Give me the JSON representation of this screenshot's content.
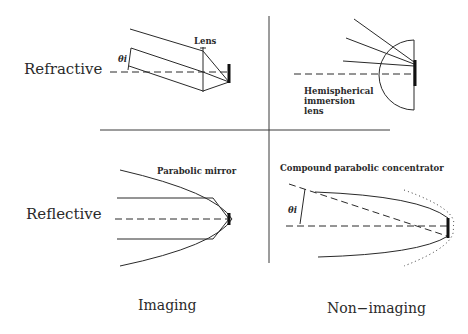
{
  "rows": [
    {
      "label": "Refractive"
    },
    {
      "label": "Reflective"
    }
  ],
  "columns": [
    {
      "label": "Imaging"
    },
    {
      "label": "Non−imaging"
    }
  ],
  "panels": {
    "refractive_imaging": {
      "annotation": "Lens",
      "angle_symbol": "θi"
    },
    "refractive_nonimaging": {
      "annotation_lines": [
        "Hemispherical",
        "immersion",
        "lens"
      ]
    },
    "reflective_imaging": {
      "annotation": "Parabolic mirror"
    },
    "reflective_nonimaging": {
      "annotation": "Compound parabolic concentrator",
      "angle_symbol": "θi"
    }
  }
}
